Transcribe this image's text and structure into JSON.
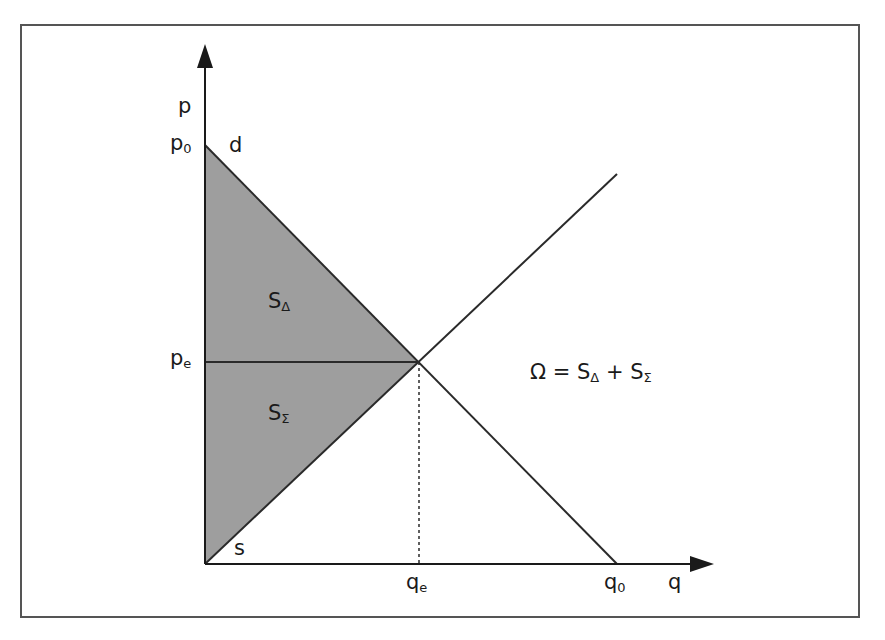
{
  "diagram": {
    "title": "",
    "colors": {
      "frame": "#555555",
      "axis": "#1a1a1a",
      "line": "#2a2a2a",
      "shaded_area": "#9e9e9e",
      "text": "#1a1a1a"
    },
    "axes": {
      "y_label": "p",
      "x_label": "q"
    },
    "ticks": {
      "p0": {
        "main": "p",
        "sub": "0"
      },
      "pe": {
        "main": "p",
        "sub": "e"
      },
      "qe": {
        "main": "q",
        "sub": "e"
      },
      "q0": {
        "main": "q",
        "sub": "0"
      }
    },
    "curves": {
      "demand_label": "d",
      "supply_label": "s"
    },
    "areas": {
      "consumer_surplus": {
        "main": "S",
        "sub": "Δ"
      },
      "producer_surplus": {
        "main": "S",
        "sub": "Σ"
      }
    },
    "equation": {
      "lhs": "Ω = S",
      "sub1": "Δ",
      "plus": " + S",
      "sub2": "Σ"
    }
  }
}
